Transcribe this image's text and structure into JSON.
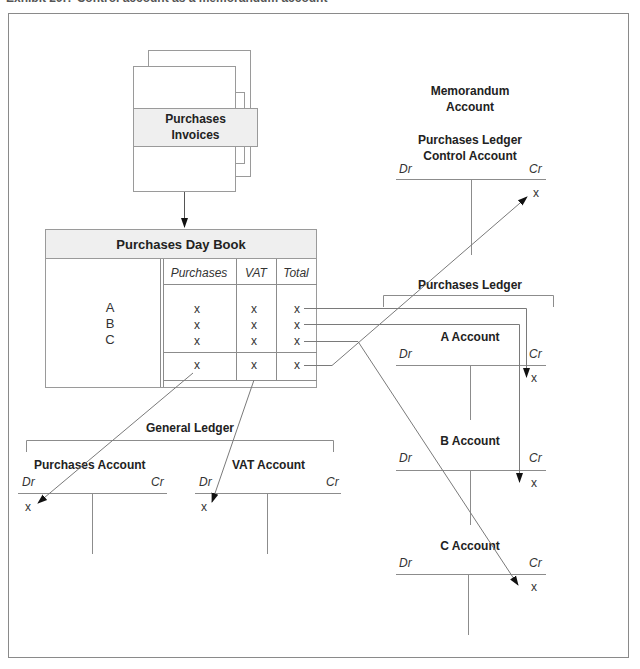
{
  "title": "Exhibit 29.? Control account as a memorandum account",
  "invoices": {
    "label_line1": "Purchases",
    "label_line2": "Invoices"
  },
  "day_book": {
    "title": "Purchases Day Book",
    "columns": [
      "Purchases",
      "VAT",
      "Total"
    ],
    "rows": [
      {
        "name": "A",
        "values": [
          "x",
          "x",
          "x"
        ]
      },
      {
        "name": "B",
        "values": [
          "x",
          "x",
          "x"
        ]
      },
      {
        "name": "C",
        "values": [
          "x",
          "x",
          "x"
        ]
      }
    ],
    "totals": [
      "x",
      "x",
      "x"
    ]
  },
  "memorandum": {
    "heading_line1": "Memorandum",
    "heading_line2": "Account",
    "control_line1": "Purchases Ledger",
    "control_line2": "Control Account",
    "dr": "Dr",
    "cr": "Cr",
    "entry": "x"
  },
  "purchases_ledger": {
    "title": "Purchases Ledger",
    "accounts": [
      {
        "name": "A Account",
        "dr": "Dr",
        "cr": "Cr",
        "entry": "x"
      },
      {
        "name": "B Account",
        "dr": "Dr",
        "cr": "Cr",
        "entry": "x"
      },
      {
        "name": "C Account",
        "dr": "Dr",
        "cr": "Cr",
        "entry": "x"
      }
    ]
  },
  "general_ledger": {
    "title": "General Ledger",
    "accounts": [
      {
        "name": "Purchases Account",
        "dr": "Dr",
        "cr": "Cr",
        "entry": "x"
      },
      {
        "name": "VAT Account",
        "dr": "Dr",
        "cr": "Cr",
        "entry": "x"
      }
    ]
  }
}
